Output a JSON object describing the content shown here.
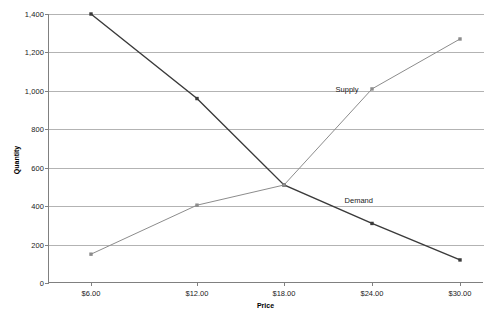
{
  "chart_data": {
    "type": "line",
    "title": "",
    "xlabel": "Price",
    "ylabel": "Quantity",
    "x": [
      6,
      12,
      18,
      24,
      30
    ],
    "categories": [
      "$6.00",
      "$12.00",
      "$18.00",
      "$24.00",
      "$30.00"
    ],
    "ylim": [
      0,
      1400
    ],
    "y_ticks": [
      0,
      200,
      400,
      600,
      800,
      1000,
      1200,
      1400
    ],
    "y_tick_labels": [
      "0",
      "200",
      "400",
      "600",
      "800",
      "1,000",
      "1,200",
      "1,400"
    ],
    "grid": "horizontal",
    "legend": "inline-annotations",
    "series": [
      {
        "name": "Demand",
        "values": [
          1400,
          960,
          510,
          310,
          120
        ],
        "color": "#3a3a3a",
        "marker": "square",
        "line_width": 1.4
      },
      {
        "name": "Supply",
        "values": [
          150,
          405,
          510,
          1010,
          1270
        ],
        "color": "#8c8c8c",
        "marker": "square",
        "line_width": 1.0
      }
    ],
    "annotations": [
      {
        "text": "Supply",
        "x_value": 22.3,
        "y_value": 1010
      },
      {
        "text": "Demand",
        "x_value": 23.1,
        "y_value": 430
      }
    ]
  },
  "axes": {
    "y_title": "Quantity",
    "x_title": "Price"
  },
  "colors": {
    "axis": "#808080",
    "grid": "#b3b3b3",
    "demand": "#3a3a3a",
    "supply": "#8c8c8c",
    "text": "#1a1a1a",
    "background": "#ffffff"
  }
}
